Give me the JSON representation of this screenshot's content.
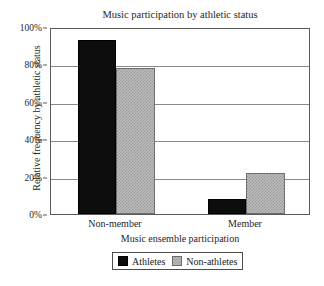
{
  "chart_data": {
    "type": "bar",
    "title": "Music participation by athletic status",
    "xlabel": "Music ensemble participation",
    "ylabel": "Relative frequency by athletic status",
    "categories": [
      "Non-member",
      "Member"
    ],
    "series": [
      {
        "name": "Athletes",
        "values": [
          93,
          8
        ],
        "color": "#0d0d0d"
      },
      {
        "name": "Non-athletes",
        "values": [
          78,
          22
        ],
        "color": "#bdbdbd"
      }
    ],
    "ylim": [
      0,
      100
    ],
    "yticks": [
      0,
      20,
      40,
      60,
      80,
      100
    ],
    "ytick_labels": [
      "0%",
      "20%",
      "40%",
      "60%",
      "80%",
      "100%"
    ],
    "grid": true,
    "legend_position": "bottom"
  }
}
